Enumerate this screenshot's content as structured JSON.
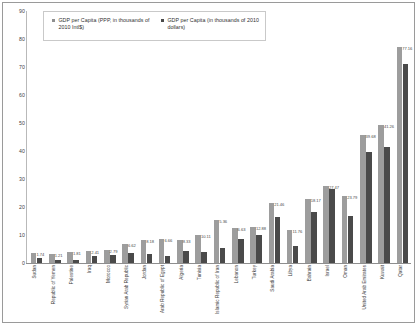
{
  "chart_data": {
    "type": "bar",
    "title": "",
    "xlabel": "",
    "ylabel": "",
    "ylim": [
      0,
      90
    ],
    "yticks": [
      0,
      10,
      20,
      30,
      40,
      50,
      60,
      70,
      80,
      90
    ],
    "grid": false,
    "legend_position": "top-left",
    "categories": [
      "Sudan",
      "Republic of Yemen",
      "Palestine",
      "Iraq",
      "Morocco",
      "Syrian Arab Republic",
      "Jordan",
      "Arab Republic of Egypt",
      "Algeria",
      "Tunisia",
      "Islamic Republic of Iran",
      "Lebanon",
      "Turkey",
      "Saudi Arabia",
      "Libya",
      "Bahrain",
      "Israel",
      "Oman",
      "United Arab Emirates",
      "Kuwait",
      "Qatar"
    ],
    "series": [
      {
        "name": "GDP per Capita (PPP, in thousands of 2010 Intl$)",
        "color": "#9d9d9d",
        "values": [
          3.74,
          3.21,
          3.81,
          4.41,
          4.79,
          6.62,
          8.18,
          8.66,
          8.33,
          10.11,
          15.36,
          12.63,
          12.88,
          21.46,
          11.76,
          22.83,
          27.47,
          23.79,
          45.68,
          49.26,
          77.16
        ]
      },
      {
        "name": "GDP per Capita (in thousands of 2010 dollars)",
        "color": "#4a4a4a",
        "values": [
          1.74,
          1.21,
          1.2,
          2.41,
          2.79,
          3.62,
          3.18,
          2.66,
          4.33,
          4.11,
          5.36,
          8.63,
          9.88,
          16.46,
          6.2,
          18.17,
          26.47,
          16.79,
          39.68,
          41.26,
          71.16
        ]
      }
    ],
    "value_labels": {
      "shown": [
        {
          "category": "Sudan",
          "text": "1.74"
        },
        {
          "category": "Republic of Yemen",
          "text": "1.21"
        },
        {
          "category": "Palestine",
          "text": "1.81"
        },
        {
          "category": "Iraq",
          "text": "2.41"
        },
        {
          "category": "Morocco",
          "text": "2.79"
        },
        {
          "category": "Syrian Arab Republic",
          "text": "6.62"
        },
        {
          "category": "Jordan",
          "text": "8.18"
        },
        {
          "category": "Arab Republic of Egypt",
          "text": "6.66"
        },
        {
          "category": "Algeria",
          "text": "8.33"
        },
        {
          "category": "Tunisia",
          "text": "10.11"
        },
        {
          "category": "Islamic Republic of Iran",
          "text": "5.36"
        },
        {
          "category": "Lebanon",
          "text": "6.63"
        },
        {
          "category": "Turkey",
          "text": "12.88"
        },
        {
          "category": "Saudi Arabia",
          "text": "21.46"
        },
        {
          "category": "Libya",
          "text": "11.76"
        },
        {
          "category": "Bahrain",
          "text": "18.17"
        },
        {
          "category": "Israel",
          "text": "27.47"
        },
        {
          "category": "Oman",
          "text": "23.79"
        },
        {
          "category": "United Arab Emirates",
          "text": "39.68"
        },
        {
          "category": "Kuwait",
          "text": "41.26"
        },
        {
          "category": "Qatar",
          "text": "77.16"
        }
      ]
    }
  },
  "legend": {
    "entries": [
      {
        "label": "GDP per Capita (PPP, in thousands of 2010 Intl$)"
      },
      {
        "label": "GDP per Capita (in thousands of 2010 dollars)"
      }
    ]
  }
}
